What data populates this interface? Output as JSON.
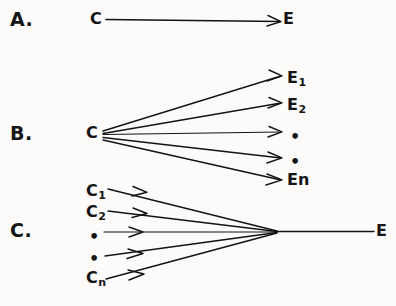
{
  "figure": {
    "background_color": "#fcfbf9",
    "ink_color": "#131313",
    "panels": [
      {
        "id": "A",
        "label": "A.",
        "relation": "one-cause-one-effect",
        "causes": [
          {
            "base": "C",
            "sub": ""
          }
        ],
        "effects": [
          {
            "base": "E",
            "sub": ""
          }
        ],
        "arrows": 1
      },
      {
        "id": "B",
        "label": "B.",
        "relation": "one-cause-many-effects",
        "causes": [
          {
            "base": "C",
            "sub": ""
          }
        ],
        "effects": [
          {
            "base": "E",
            "sub": "1"
          },
          {
            "base": "E",
            "sub": "2"
          },
          {
            "base": "•",
            "sub": ""
          },
          {
            "base": "•",
            "sub": ""
          },
          {
            "base": "E",
            "sub": "n"
          }
        ],
        "arrows": 5
      },
      {
        "id": "C",
        "label": "C.",
        "relation": "many-causes-one-effect",
        "causes": [
          {
            "base": "C",
            "sub": "1"
          },
          {
            "base": "C",
            "sub": "2"
          },
          {
            "base": "•",
            "sub": ""
          },
          {
            "base": "•",
            "sub": ""
          },
          {
            "base": "C",
            "sub": "n"
          }
        ],
        "effects": [
          {
            "base": "E",
            "sub": ""
          }
        ],
        "arrows": 5
      }
    ]
  },
  "panel_a": {
    "label": "A.",
    "cause": "C",
    "effect": "E"
  },
  "panel_b": {
    "label": "B.",
    "cause": "C",
    "effect_1_base": "E",
    "effect_1_sub": "1",
    "effect_2_base": "E",
    "effect_2_sub": "2",
    "effect_dot_1": "•",
    "effect_dot_2": "•",
    "effect_n_base": "E",
    "effect_n_sub": "n"
  },
  "panel_c": {
    "label": "C.",
    "cause_1_base": "C",
    "cause_1_sub": "1",
    "cause_2_base": "C",
    "cause_2_sub": "2",
    "cause_dot_1": "•",
    "cause_dot_2": "•",
    "cause_n_base": "C",
    "cause_n_sub": "n",
    "effect": "E"
  }
}
